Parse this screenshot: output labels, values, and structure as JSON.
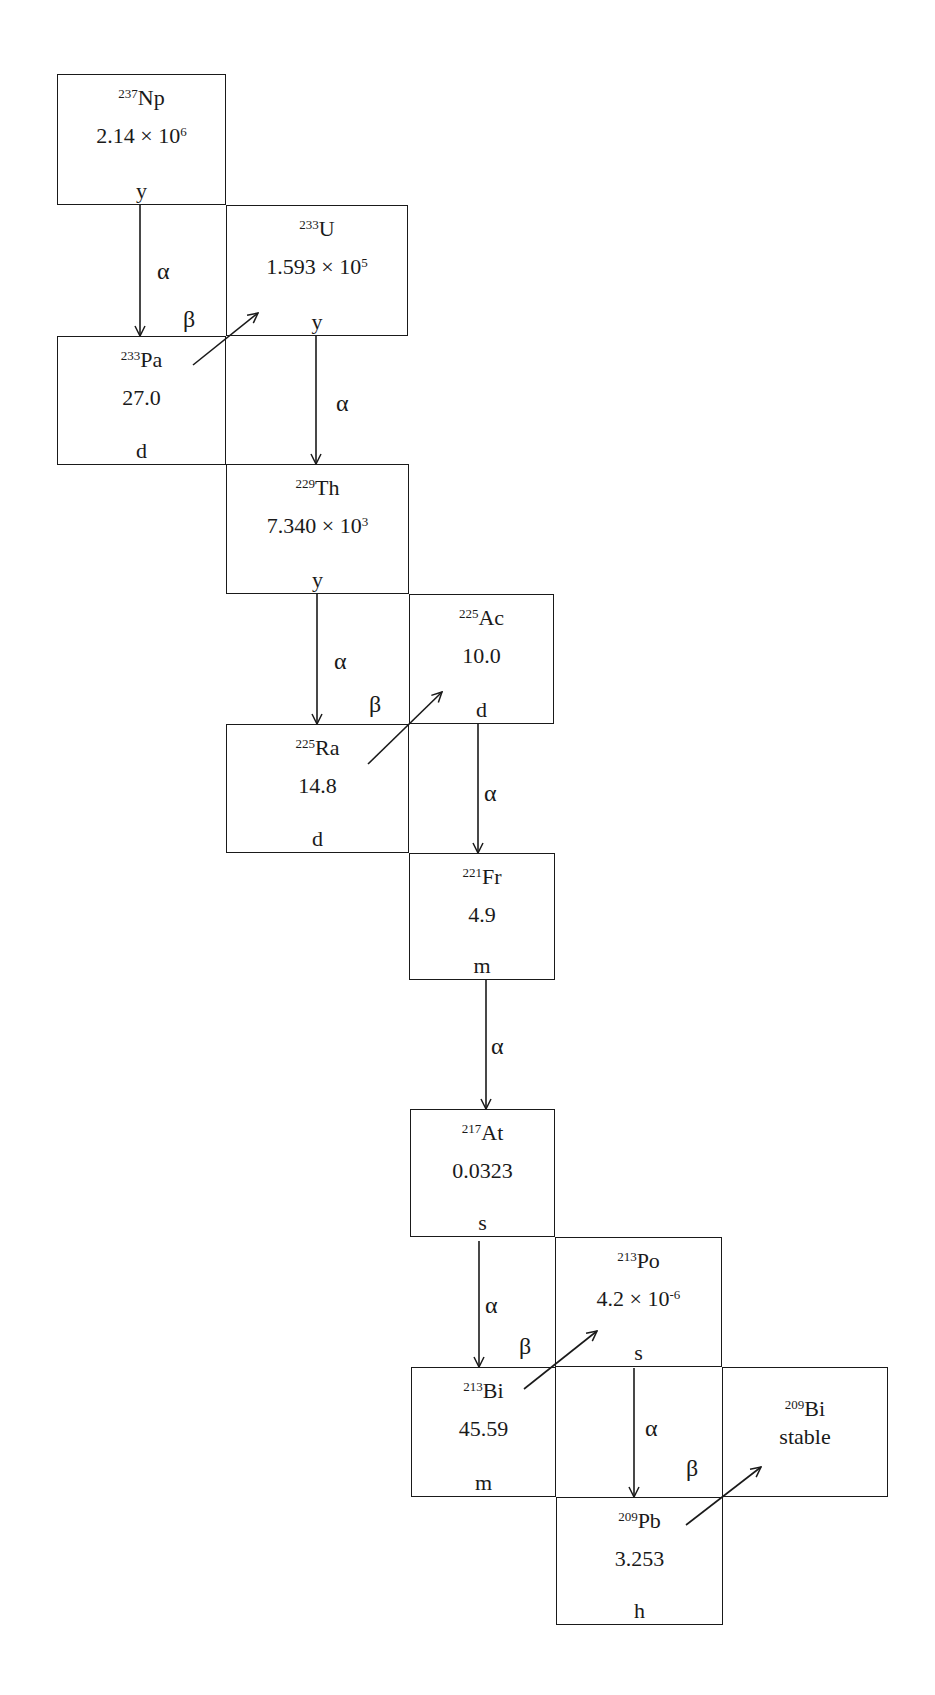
{
  "diagram": {
    "line_color": "#1a1a1a",
    "background": "#ffffff",
    "nuclides": [
      {
        "id": "np237",
        "mass": "237",
        "symbol": "Np",
        "value": "2.14 × 10",
        "exp": "6",
        "unit": "y",
        "box": [
          57,
          74,
          169,
          131
        ]
      },
      {
        "id": "u233",
        "mass": "233",
        "symbol": "U",
        "value": "1.593 × 10",
        "exp": "5",
        "unit": "y",
        "box": [
          226,
          205,
          182,
          131
        ]
      },
      {
        "id": "pa233",
        "mass": "233",
        "symbol": "Pa",
        "value": "27.0",
        "exp": "",
        "unit": "d",
        "box": [
          57,
          336,
          169,
          129
        ]
      },
      {
        "id": "th229",
        "mass": "229",
        "symbol": "Th",
        "value": "7.340 × 10",
        "exp": "3",
        "unit": "y",
        "box": [
          226,
          464,
          183,
          130
        ]
      },
      {
        "id": "ac225",
        "mass": "225",
        "symbol": "Ac",
        "value": "10.0",
        "exp": "",
        "unit": "d",
        "box": [
          409,
          594,
          145,
          130
        ]
      },
      {
        "id": "ra225",
        "mass": "225",
        "symbol": "Ra",
        "value": "14.8",
        "exp": "",
        "unit": "d",
        "box": [
          226,
          724,
          183,
          129
        ]
      },
      {
        "id": "fr221",
        "mass": "221",
        "symbol": "Fr",
        "value": "4.9",
        "exp": "",
        "unit": "m",
        "box": [
          409,
          853,
          146,
          127
        ]
      },
      {
        "id": "at217",
        "mass": "217",
        "symbol": "At",
        "value": "0.0323",
        "exp": "",
        "unit": "s",
        "box": [
          410,
          1109,
          145,
          128
        ]
      },
      {
        "id": "po213",
        "mass": "213",
        "symbol": "Po",
        "value": "4.2 × 10",
        "exp": "-6",
        "unit": "s",
        "box": [
          555,
          1237,
          167,
          130
        ]
      },
      {
        "id": "bi213",
        "mass": "213",
        "symbol": "Bi",
        "value": "45.59",
        "exp": "",
        "unit": "m",
        "box": [
          411,
          1367,
          145,
          130
        ]
      },
      {
        "id": "bi209",
        "mass": "209",
        "symbol": "Bi",
        "value": "stable",
        "exp": "",
        "unit": "",
        "box": [
          722,
          1367,
          166,
          130
        ]
      },
      {
        "id": "pb209",
        "mass": "209",
        "symbol": "Pb",
        "value": "3.253",
        "exp": "",
        "unit": "h",
        "box": [
          556,
          1497,
          167,
          128
        ]
      }
    ],
    "decays": [
      {
        "from": "np237",
        "to": "pa233",
        "type": "alpha",
        "label": "α",
        "x1": 140,
        "y1": 205,
        "x2": 140,
        "y2": 336,
        "lx": 157,
        "ly": 273
      },
      {
        "from": "pa233",
        "to": "u233",
        "type": "beta",
        "label": "β",
        "x1": 193,
        "y1": 365,
        "x2": 258,
        "y2": 313,
        "lx": 183,
        "ly": 321
      },
      {
        "from": "u233",
        "to": "th229",
        "type": "alpha",
        "label": "α",
        "x1": 316,
        "y1": 336,
        "x2": 316,
        "y2": 464,
        "lx": 336,
        "ly": 405
      },
      {
        "from": "th229",
        "to": "ra225",
        "type": "alpha",
        "label": "α",
        "x1": 317,
        "y1": 594,
        "x2": 317,
        "y2": 724,
        "lx": 334,
        "ly": 663
      },
      {
        "from": "ra225",
        "to": "ac225",
        "type": "beta",
        "label": "β",
        "x1": 368,
        "y1": 764,
        "x2": 442,
        "y2": 692,
        "lx": 369,
        "ly": 706
      },
      {
        "from": "ac225",
        "to": "fr221",
        "type": "alpha",
        "label": "α",
        "x1": 478,
        "y1": 724,
        "x2": 478,
        "y2": 853,
        "lx": 484,
        "ly": 795
      },
      {
        "from": "fr221",
        "to": "at217",
        "type": "alpha",
        "label": "α",
        "x1": 486,
        "y1": 980,
        "x2": 486,
        "y2": 1109,
        "lx": 491,
        "ly": 1048
      },
      {
        "from": "at217",
        "to": "bi213",
        "type": "alpha",
        "label": "α",
        "x1": 479,
        "y1": 1241,
        "x2": 479,
        "y2": 1367,
        "lx": 485,
        "ly": 1307
      },
      {
        "from": "bi213",
        "to": "po213",
        "type": "beta",
        "label": "β",
        "x1": 524,
        "y1": 1389,
        "x2": 597,
        "y2": 1331,
        "lx": 519,
        "ly": 1348
      },
      {
        "from": "po213",
        "to": "pb209",
        "type": "alpha",
        "label": "α",
        "x1": 634,
        "y1": 1368,
        "x2": 634,
        "y2": 1497,
        "lx": 645,
        "ly": 1430
      },
      {
        "from": "pb209",
        "to": "bi209",
        "type": "beta",
        "label": "β",
        "x1": 686,
        "y1": 1525,
        "x2": 761,
        "y2": 1467,
        "lx": 686,
        "ly": 1470
      }
    ]
  }
}
